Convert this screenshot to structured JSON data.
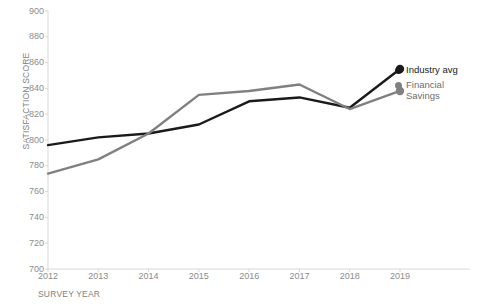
{
  "chart_data": {
    "type": "line",
    "title": "",
    "xlabel": "SURVEY YEAR",
    "ylabel": "SATISFACTION SCORE",
    "categories": [
      "2012",
      "2013",
      "2014",
      "2015",
      "2016",
      "2017",
      "2018",
      "2019"
    ],
    "x": [
      2012,
      2013,
      2014,
      2015,
      2016,
      2017,
      2018,
      2019
    ],
    "ylim": [
      700,
      900
    ],
    "yticks": [
      700,
      720,
      740,
      760,
      780,
      800,
      820,
      840,
      860,
      880,
      900
    ],
    "grid": false,
    "legend_position": "right",
    "series": [
      {
        "name": "Industry avg",
        "color": "#1a1a1a",
        "end_marker": true,
        "values": [
          796,
          802,
          805,
          812,
          830,
          833,
          825,
          855
        ]
      },
      {
        "name": "Financial Savings",
        "color": "#808080",
        "end_marker": true,
        "values": [
          774,
          785,
          805,
          835,
          838,
          843,
          824,
          838
        ]
      }
    ]
  },
  "axis": {
    "y_title": "SATISFACTION SCORE",
    "x_title": "SURVEY YEAR",
    "y_tick_labels": [
      "900",
      "880",
      "860",
      "840",
      "820",
      "800",
      "780",
      "760",
      "740",
      "720",
      "700"
    ],
    "x_tick_labels": [
      "2012",
      "2013",
      "2014",
      "2015",
      "2016",
      "2017",
      "2018",
      "2019"
    ]
  },
  "legend": {
    "items": [
      {
        "label": "Industry avg",
        "color": "#1a1a1a"
      },
      {
        "label": "Financial Savings",
        "label_line1": "Financial",
        "label_line2": "Savings",
        "color": "#808080"
      }
    ]
  },
  "colors": {
    "industry_avg": "#1a1a1a",
    "financial_savings": "#808080",
    "axis": "#d9d9d9",
    "tick_text": "#8c8c8c",
    "axis_title_text": "#7f7f7f"
  }
}
